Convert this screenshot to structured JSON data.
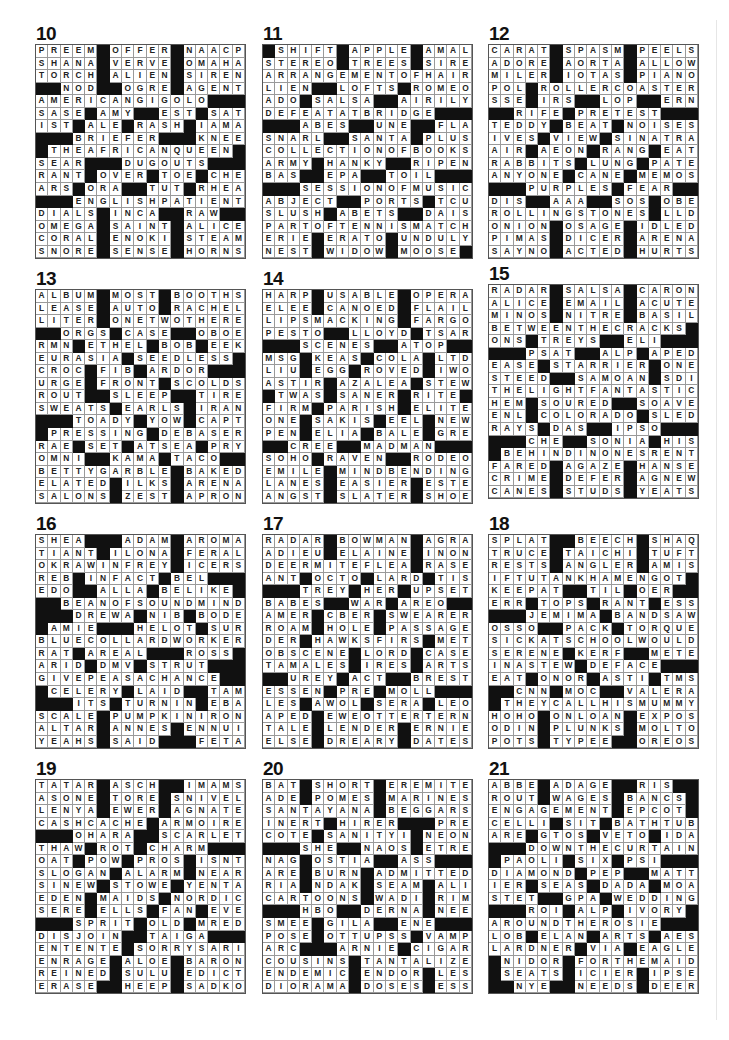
{
  "page": {
    "background": "#ffffff",
    "black_square_color": "#111111",
    "grid_cols": 17,
    "grid_rows": 17
  },
  "puzzles": [
    {
      "number": "10",
      "rows": [
        "PREEM#OFFER#NAACP",
        "SHANA#VERVE#OMAHA",
        "TORCH#ALIEN#SIREN",
        "##NOD##OGRE#AGENT",
        "AMERICANGIGOLO###",
        "SASE#AMY##EST#SAT",
        "IST#ALE#RASH#IAMA",
        "###BRIEFER###KNEE",
        "#THEAFRICANQUEEN#",
        "SEAR###DUGOUTS###",
        "RANT#OVER#TOE#CHE",
        "ARS#ORA##TUT#RHEA",
        "###ENGLISHPATIENT",
        "DIALS#INCA##RAW##",
        "OMEGA#SAINT#ALICE",
        "CORAL#ENOKI#STEAM",
        "SNORE#SENSE#HORNS"
      ]
    },
    {
      "number": "11",
      "rows": [
        "#SHIFT#APPLE#AMAL",
        "STEREO#TREES#SIRE",
        "ARRANGEMENTOFHAIR",
        "LIEN##LOFTS#ROMEO",
        "ADO#SALSA##AIRILY",
        "DEFEATATBRIDGE###",
        "###ABES##UNE##FLA",
        "SNARL##SANTA#PLUS",
        "COLLECTIONOFBOOKS",
        "ARMY#HANKY##RIPEN",
        "BAS##EPA##TOIL###",
        "###SESSIONOFMUSIC",
        "ABJECT##PORTS#TCU",
        "SLUSH#ABETS##DAIS",
        "PARTOFTENNISMATCH",
        "ERIE#ERATO#UNDULY",
        "NEST#WIDOW#MOOSE#"
      ]
    },
    {
      "number": "12",
      "rows": [
        "CARAT#SPASM#PEELS",
        "ADORE#AORTA#ALLOW",
        "MILER#IOTAS#PIANO",
        "POL#ROLLERCOASTER",
        "SSE#IRS##LOP##ERN",
        "##RIFE#PRETEST###",
        "TEDDY#BEAT#NOISES",
        "IVES#VIEW#SINATRA",
        "AIR#AEON#RANG#EAT",
        "RABBITS#LUNG#PATE",
        "ANYONE#CANE#MEMOS",
        "###PURPLES#FEAR##",
        "DIS##AAA##SOS#OBE",
        "ROLLINGSTONES#LLD",
        "ONION#OSAGE#IDLED",
        "PIMAS#DICER#ARENA",
        "SAYNO#ACTED#HURTS"
      ]
    },
    {
      "number": "13",
      "rows": [
        "ALBUM#MOST#BOOTHS",
        "LEASE#AUTO#RACHEL",
        "LITER#ONETWOTHERE",
        "##ORGS#CASE##OBOE",
        "RMN#ETHEL#BOB#EEK",
        "EURASIA#SEEDLESS#",
        "CROC#FIB#ARDOR###",
        "URGE#FRONT#SCOLDS",
        "ROUT##SLEEP##TIRE",
        "SWEATS#EARLS#IRAN",
        "###TOADY#YOW#CAPT",
        "#PRESSING#DEBASER",
        "RAE#SET#ATSEA#PRY",
        "OMNI##KAMA#TACO##",
        "BETTYGARBLE#BAKED",
        "ELATED#ILKS#ARENA",
        "SALONS#ZEST#APRON"
      ]
    },
    {
      "number": "14",
      "rows": [
        "HARP#USABLE#OPERA",
        "ELEE#CANOED#FLAIL",
        "LIPSMACKING#FARGO",
        "PESTO##LLOYD#TSAR",
        "###SCENES##ATOP##",
        "MSG#KEAS#COLA#LTD",
        "LIU#EGG#ROVED#IWO",
        "ASTIR#AZALEA#STEW",
        "#TWAS#SANER#RITE#",
        "FIRM#PARISH#ELITE",
        "ONE#SAKIS#EEL#NEW",
        "PEN#ELIA#BALE#GRE",
        "##CREE##MADMAN###",
        "SOHO#RAVEN##RODEO",
        "EMILE#MINDBENDING",
        "LANES#EASIER#ESTE",
        "ANGST#SLATER#SHOE"
      ]
    },
    {
      "number": "15",
      "rows": [
        "RADAR#SALSA#CARON",
        "ALICE#EMAIL#ACUTE",
        "MINOS#NITRE#BASIL",
        "BETWEENTHECRACKS#",
        "ONS#TREYS##ELI###",
        "###PSAT##ALP#APED",
        "EASE#STARRIER#ONE",
        "STEED##SAMOAN#SDI",
        "THELIGHTFANTASTIC",
        "HEM#SOURED##SOAVE",
        "ENL#COLORADO#SLED",
        "RAYS#DAS##IPSO###",
        "###CHE##SONIA#HIS",
        "#BEHINDINONESRENT",
        "FARED#AGAZE#HANSE",
        "CRIME#DEFER#AGNEW",
        "CANES#STUDS#YEATS"
      ]
    },
    {
      "number": "16",
      "rows": [
        "SHEA###ADAM#AROMA",
        "TIANT#ILONA#FERAL",
        "OKRAWINFREY#ICERS",
        "REB#INFACT#BEL###",
        "EDO##ALLA#BELIKE#",
        "##BEANOFSOUNDMIND",
        "###DREWA#NIB#BODE",
        "#AMIE###HELOT#SUR",
        "BLUECOLLARDWORKER",
        "RAT#AREAL###ROSS#",
        "ARID#DMV#STRUT###",
        "GIVEPEASACHANCE##",
        "#CELERY#LAID##TAM",
        "###ITS#TURNIN#EBA",
        "SCALE#PUMPKINIRON",
        "ALTAR#ANNES#ENNUI",
        "YEAHS#SAID###FETA"
      ]
    },
    {
      "number": "17",
      "rows": [
        "RADAR#BOWMAN#AGRA",
        "ADIEU#ELAINE#INON",
        "DEERMITEFLEA#RASE",
        "ANT#OCTO#LARD#TIS",
        "###TREY#HER#UPSET",
        "BABES##WAR#AREO##",
        "AMER#CBER#SWEARER",
        "ROAM#HOLE#PASSAGE",
        "DER#HAWKSFIRS#MET",
        "OBSCENE#LORD#CASE",
        "TAMALES#IRES#ARTS",
        "##UREY#ACT##BREST",
        "ESSEN#PRE#MOLL###",
        "LES#AWOL#SERA#LEO",
        "APED#EWEOTTERTERN",
        "TALE#LENDER#ERNIE",
        "ELSE#DREARY#DATES"
      ]
    },
    {
      "number": "18",
      "rows": [
        "SPLAT##BEECH#SHAQ",
        "TRUCE#TAICHI#TUFT",
        "RESTS#ANGLER#AMIS",
        "IFTUTANKHAMENGOT#",
        "KEEPAT##TIL#OER##",
        "ERR#TOPS#RANT#ESS",
        "###JEMIMA#BANDSAW",
        "OSSO##PACK#TORQUE",
        "SICKATSCHOOLWOULD",
        "SERENE#KERF##METE",
        "INASTEW#DEFACE###",
        "EAT#ONOR#ASTI#TMS",
        "##CNN#MOC##VALERA",
        "#THEYCALLHISMUMMY",
        "HOHO#ONLOAN#EXPOS",
        "ODIN#PLUNKS#MOLTO",
        "POTS#TYPEE##OREOS"
      ]
    },
    {
      "number": "19",
      "rows": [
        "TATAR#ASCH##IMAMS",
        "ASONE#TORE#SNIVEL",
        "LENYA#EWER#AGNATE",
        "CASHCACHE#ARMOIRE",
        "###OHARA##SCARLET",
        "THAW#ROT#CHARM###",
        "OAT#POW#PROS#ISNT",
        "SLOGAN#ALARM#NEAR",
        "SINEW#STOWE#YENTA",
        "EDEN#MAIDS#NORDIC",
        "SERE#ELLS#FAN#EVE",
        "###SPRIT#OLD#MRED",
        "DISJOIN##TAIGA###",
        "ENTENTE#SORRYSARI",
        "ENRAGE#ALOE#BARON",
        "REINED#SULU#EDICT",
        "ERASE##HEEP#SADKO"
      ]
    },
    {
      "number": "20",
      "rows": [
        "BAT#SHORT#EREMITE",
        "ADE#POMES#MARINES",
        "SANTAYANA#BEGGARS",
        "INERT#HIRER###PRE",
        "COTE#SANITYI#NEON",
        "###SHE##NAOS#ETRE",
        "NAG#OSTIA##ASS###",
        "ARE#BURN#ADMITTED",
        "RIA#NDAK#SEAM#ALI",
        "CARTOONS#WADI#RIM",
        "###HBO##DERNA#NEE",
        "SMEE#GILA##ENE###",
        "POSE#OTTUPSS#VAMP",
        "ARC###ARNIE#CIGAR",
        "COUSINS#TANTALIZE",
        "ENDEMIC#ENDOR#LES",
        "DIORAMA#DOSES#ESS"
      ]
    },
    {
      "number": "21",
      "rows": [
        "ABBE#ADAGE##RIS##",
        "ROUT#WAGES#BANCS#",
        "ENGAGEMENT#EPCOT#",
        "CELLI#SIT#BATHTUB",
        "ARE#GTOS#VETO#IDA",
        "###DOWNTHECURTAIN",
        "#PAOLI#SIX#PSI###",
        "DIAMOND#PEP##MATT",
        "IER#SEAS#DADA#MOA",
        "STET##GPA#WEDDING",
        "###ROI#ALP#IVORY#",
        "AROUNDTHEROSIE###",
        "LOB#ELAN#ARTS#AES",
        "LARDNER#VIA#EAGLE",
        "#NIDOR#FORTHEMAID",
        "#SEATS#ICIER#IPSE",
        "##NYE##NEEDS#DEER"
      ]
    }
  ]
}
